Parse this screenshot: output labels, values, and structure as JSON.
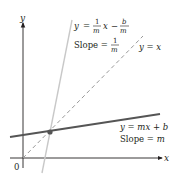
{
  "figure": {
    "axes": {
      "x_label": "x",
      "y_label": "y",
      "origin_label": "0"
    },
    "lines": [
      {
        "id": "line-original",
        "equation": "y = mx + b",
        "slope_label": "Slope = m",
        "style": "solid",
        "color": "#555555"
      },
      {
        "id": "line-identity",
        "equation": "y = x",
        "style": "dashed",
        "color": "#999999"
      },
      {
        "id": "line-inverse",
        "equation": "y = (1/m)x − b/m",
        "slope_label": "Slope = 1/m",
        "style": "solid",
        "color": "#c8c8c8"
      }
    ],
    "labels": {
      "inverse_eq_y": "y",
      "inverse_eq_equals": "=",
      "inverse_eq_frac1_num": "1",
      "inverse_eq_frac1_den": "m",
      "inverse_eq_x": "x",
      "inverse_eq_minus": "−",
      "inverse_eq_frac2_num": "b",
      "inverse_eq_frac2_den": "m",
      "inverse_slope_text": "Slope =",
      "inverse_slope_num": "1",
      "inverse_slope_den": "m",
      "identity_eq": "y = x",
      "original_eq": "y = mx + b",
      "original_slope_text": "Slope = ",
      "original_slope_m": "m"
    },
    "intersection_point": {
      "description": "intersection of the three lines",
      "color": "#555555"
    }
  }
}
